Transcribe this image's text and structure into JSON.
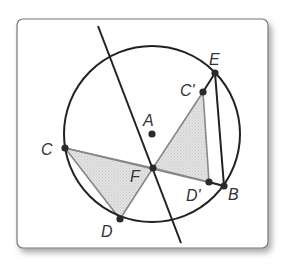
{
  "diagram": {
    "type": "geometry-circle-reflection",
    "frame": {
      "x": 17,
      "y": 19,
      "width": 251,
      "height": 229,
      "radius": 6,
      "border_color": "#777777",
      "shadow": true
    },
    "circle": {
      "name": "circle-A",
      "cx": 152,
      "cy": 134,
      "r": 88,
      "stroke": "#222222"
    },
    "line": {
      "name": "reflection-line",
      "x1": 98,
      "y1": 26,
      "x2": 181,
      "y2": 243,
      "stroke": "#222222"
    },
    "points": {
      "A": {
        "x": 152,
        "y": 134,
        "label": "A",
        "lx": 143,
        "ly": 126
      },
      "C": {
        "x": 65,
        "y": 148,
        "label": "C",
        "lx": 41,
        "ly": 155
      },
      "D": {
        "x": 120,
        "y": 219,
        "label": "D",
        "lx": 101,
        "ly": 237
      },
      "F": {
        "x": 153,
        "y": 168,
        "label": "F",
        "lx": 130,
        "ly": 182
      },
      "E": {
        "x": 215,
        "y": 73,
        "label": "E",
        "lx": 209,
        "ly": 65
      },
      "C_prime": {
        "x": 203,
        "y": 92,
        "label": "C'",
        "lx": 180,
        "ly": 96
      },
      "D_prime": {
        "x": 209,
        "y": 182,
        "label": "D'",
        "lx": 186,
        "ly": 201
      },
      "B": {
        "x": 224,
        "y": 186,
        "label": "B",
        "lx": 228,
        "ly": 200
      }
    },
    "triangles": [
      {
        "name": "triangle-CDF",
        "points": [
          "C",
          "D",
          "F"
        ],
        "fill": "#dcdcdc",
        "stroke": "#888888"
      },
      {
        "name": "triangle-C'D'F",
        "points": [
          "C_prime",
          "D_prime",
          "F"
        ],
        "fill": "#dcdcdc",
        "stroke": "#888888"
      }
    ],
    "segments": [
      {
        "name": "segment-CB",
        "from": "C",
        "to": "B",
        "stroke": "#888888"
      },
      {
        "name": "segment-EB",
        "from": "E",
        "to": "B",
        "stroke": "#222222"
      },
      {
        "name": "segment-EC'",
        "from": "E",
        "to": "C_prime",
        "stroke": "#222222"
      },
      {
        "name": "segment-D'B",
        "from": "D_prime",
        "to": "B",
        "stroke": "#222222"
      }
    ],
    "labels": [
      "A",
      "B",
      "C",
      "C'",
      "D",
      "D'",
      "E",
      "F"
    ]
  }
}
